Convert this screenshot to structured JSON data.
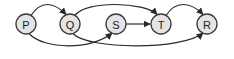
{
  "diagram": {
    "type": "directed-graph",
    "nodes": [
      {
        "id": "P",
        "label": "P"
      },
      {
        "id": "Q",
        "label": "Q"
      },
      {
        "id": "S",
        "label": "S"
      },
      {
        "id": "T",
        "label": "T"
      },
      {
        "id": "R",
        "label": "R"
      }
    ],
    "edges": [
      {
        "from": "P",
        "to": "Q",
        "route": "over"
      },
      {
        "from": "P",
        "to": "S",
        "route": "under"
      },
      {
        "from": "Q",
        "to": "T",
        "route": "over"
      },
      {
        "from": "Q",
        "to": "R",
        "route": "under"
      },
      {
        "from": "S",
        "to": "T",
        "route": "straight"
      },
      {
        "from": "T",
        "to": "R",
        "route": "over"
      }
    ],
    "colors": {
      "node_fill": "#e4e4e4",
      "stroke": "#2a2a2a",
      "background": "#ffffff"
    }
  }
}
